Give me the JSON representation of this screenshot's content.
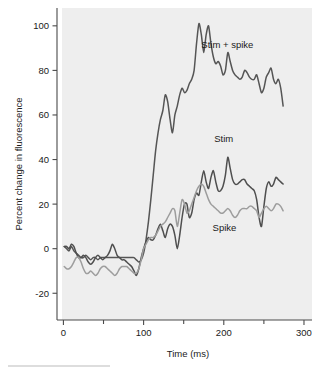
{
  "chart_data": {
    "type": "line",
    "title": "",
    "xlabel": "Time (ms)",
    "ylabel": "Percent change in fluorescence",
    "xlim": [
      -8,
      310
    ],
    "ylim": [
      -32,
      108
    ],
    "xticks": [
      0,
      100,
      200,
      300
    ],
    "xticks_minor": [
      50,
      150,
      250
    ],
    "xtick_labels": [
      "0",
      "100",
      "200",
      "300"
    ],
    "yticks": [
      -20,
      0,
      20,
      40,
      60,
      80,
      100
    ],
    "ytick_labels": [
      "-20",
      "0",
      "20",
      "40",
      "60",
      "80",
      "100"
    ],
    "grid": false,
    "legend_position": "inline-annotations",
    "plot_background": "#eeeeee",
    "series": [
      {
        "name": "Stim + spike",
        "color": "#555555",
        "line_width": 1.5,
        "label_x": 172,
        "label_y": 90,
        "x": [
          1,
          4,
          7,
          10,
          13,
          16,
          19,
          22,
          25,
          28,
          31,
          34,
          37,
          40,
          43,
          46,
          49,
          52,
          55,
          58,
          61,
          64,
          67,
          70,
          73,
          76,
          79,
          82,
          85,
          88,
          91,
          94,
          97,
          100,
          103,
          106,
          109,
          112,
          115,
          118,
          121,
          124,
          127,
          130,
          133,
          136,
          139,
          142,
          145,
          148,
          151,
          154,
          157,
          160,
          163,
          166,
          169,
          172,
          175,
          178,
          181,
          184,
          187,
          190,
          193,
          196,
          199,
          202,
          205,
          208,
          211,
          214,
          217,
          220,
          223,
          226,
          229,
          232,
          235,
          238,
          241,
          244,
          247,
          250,
          253,
          256,
          259,
          262,
          265,
          268,
          271,
          274
        ],
        "y": [
          1,
          0,
          -1,
          1,
          -1,
          -2,
          -3,
          -4,
          -4,
          -3,
          -4,
          -5,
          -4,
          -4,
          -5,
          -4,
          -4,
          -4,
          -4,
          -4,
          -4,
          -4,
          -4,
          -4,
          -4,
          -4,
          -4,
          -4,
          -4,
          -4,
          -5,
          -6,
          -5,
          -2,
          4,
          12,
          22,
          33,
          44,
          52,
          58,
          62,
          69,
          66,
          58,
          52,
          60,
          64,
          69,
          72,
          70,
          71,
          74,
          76,
          80,
          92,
          101,
          96,
          88,
          96,
          100,
          92,
          86,
          83,
          84,
          82,
          78,
          80,
          88,
          84,
          80,
          78,
          77,
          76,
          77,
          80,
          79,
          77,
          76,
          76,
          78,
          74,
          70,
          72,
          77,
          79,
          81,
          76,
          74,
          76,
          72,
          64
        ]
      },
      {
        "name": "Stim",
        "color": "#4f4f4f",
        "line_width": 1.5,
        "label_x": 188,
        "label_y": 48,
        "x": [
          1,
          4,
          7,
          10,
          13,
          16,
          19,
          22,
          25,
          28,
          31,
          34,
          37,
          40,
          43,
          46,
          49,
          52,
          55,
          58,
          61,
          64,
          67,
          70,
          73,
          76,
          79,
          82,
          85,
          88,
          91,
          94,
          97,
          100,
          103,
          106,
          109,
          112,
          115,
          118,
          121,
          124,
          127,
          130,
          133,
          136,
          139,
          142,
          145,
          148,
          151,
          154,
          157,
          160,
          163,
          166,
          169,
          172,
          175,
          178,
          181,
          184,
          187,
          190,
          193,
          196,
          199,
          202,
          205,
          208,
          211,
          214,
          217,
          220,
          223,
          226,
          229,
          232,
          235,
          238,
          241,
          244,
          247,
          250,
          253,
          256,
          259,
          262,
          265,
          268,
          271,
          274
        ],
        "y": [
          1,
          1,
          0,
          2,
          1,
          -2,
          -4,
          -4,
          -3,
          -4,
          -6,
          -7,
          -6,
          -4,
          -3,
          -4,
          -5,
          -4,
          -3,
          -1,
          2,
          0,
          -3,
          -4,
          -5,
          -5,
          -6,
          -7,
          -8,
          -10,
          -12,
          -9,
          -4,
          0,
          3,
          5,
          4,
          4,
          6,
          9,
          11,
          8,
          5,
          9,
          11,
          10,
          6,
          0,
          6,
          14,
          20,
          20,
          14,
          16,
          22,
          25,
          24,
          30,
          35,
          30,
          27,
          32,
          35,
          30,
          26,
          26,
          28,
          33,
          41,
          36,
          31,
          29,
          29,
          30,
          31,
          31,
          29,
          28,
          27,
          26,
          22,
          14,
          10,
          19,
          27,
          30,
          28,
          29,
          32,
          31,
          30,
          29
        ]
      },
      {
        "name": "Spike",
        "color": "#9d9d9d",
        "line_width": 1.5,
        "label_x": 186,
        "label_y": 8,
        "x": [
          1,
          4,
          7,
          10,
          13,
          16,
          19,
          22,
          25,
          28,
          31,
          34,
          37,
          40,
          43,
          46,
          49,
          52,
          55,
          58,
          61,
          64,
          67,
          70,
          73,
          76,
          79,
          82,
          85,
          88,
          91,
          94,
          97,
          100,
          103,
          106,
          109,
          112,
          115,
          118,
          121,
          124,
          127,
          130,
          133,
          136,
          139,
          142,
          145,
          148,
          151,
          154,
          157,
          160,
          163,
          166,
          169,
          172,
          175,
          178,
          181,
          184,
          187,
          190,
          193,
          196,
          199,
          202,
          205,
          208,
          211,
          214,
          217,
          220,
          223,
          226,
          229,
          232,
          235,
          238,
          241,
          244,
          247,
          250,
          253,
          256,
          259,
          262,
          265,
          268,
          271,
          274
        ],
        "y": [
          -8,
          -9,
          -9,
          -8,
          -6,
          -4,
          -4,
          -6,
          -9,
          -11,
          -11,
          -10,
          -11,
          -12,
          -11,
          -9,
          -8,
          -8,
          -9,
          -10,
          -11,
          -12,
          -11,
          -9,
          -8,
          -8,
          -8,
          -9,
          -10,
          -11,
          -11,
          -9,
          -5,
          0,
          2,
          4,
          5,
          5,
          6,
          8,
          10,
          11,
          12,
          14,
          16,
          18,
          17,
          10,
          16,
          22,
          20,
          16,
          17,
          20,
          23,
          26,
          28,
          29,
          28,
          25,
          22,
          20,
          19,
          18,
          17,
          16,
          16,
          17,
          18,
          17,
          15,
          14,
          15,
          17,
          18,
          18,
          18,
          19,
          19,
          18,
          17,
          14,
          16,
          18,
          19,
          18,
          17,
          18,
          20,
          20,
          19,
          17
        ]
      }
    ]
  }
}
